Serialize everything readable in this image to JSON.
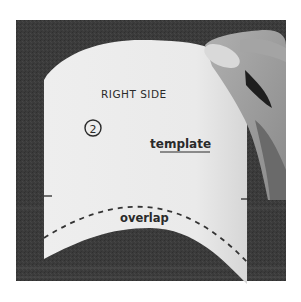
{
  "image": {
    "description": "Photo of a white paper sewing template on a dark textured surface, held at the top-right corner by a hand",
    "colors": {
      "background_page": "#ffffff",
      "surface": "#3a3a3a",
      "surface_stripe": "#555555",
      "paper": "#ececec",
      "ink": "#2a2a2a",
      "skin": "#9a9a9a",
      "skin_shadow": "#6a6a6a"
    }
  },
  "template": {
    "heading": "RIGHT SIDE",
    "number_label": "2",
    "type_label": "template",
    "seam_label": "overlap"
  }
}
